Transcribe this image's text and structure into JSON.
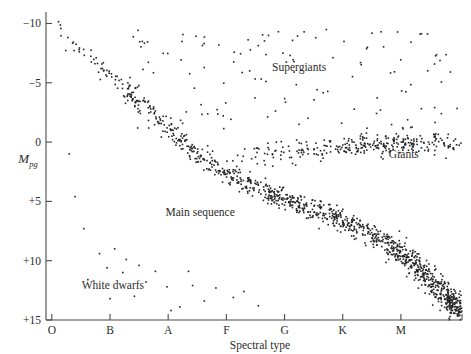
{
  "chart_data": {
    "type": "scatter",
    "title": "",
    "subtitle": "",
    "xlabel": "Spectral type",
    "ylabel": "M",
    "ylabel_subscript": "pg",
    "ylabel_full": "Mpg",
    "grid": false,
    "legend_position": "none",
    "x_tick_labels": [
      "O",
      "B",
      "A",
      "F",
      "G",
      "K",
      "M"
    ],
    "x_tick_values": [
      0,
      1,
      2,
      3,
      4,
      5,
      6
    ],
    "xlim": [
      -0.1,
      7.05
    ],
    "y_tick_labels": [
      "−10",
      "−5",
      "0",
      "+5",
      "+10",
      "+15"
    ],
    "y_tick_values": [
      -10,
      -5,
      0,
      5,
      10,
      15
    ],
    "ylim": [
      -10.8,
      15.0
    ],
    "y_axis_inverted": true,
    "point_color": "#242424",
    "point_size_px": 1.6,
    "axis_color": "#4a4a4a",
    "background_color": "#ffffff",
    "annotations": [
      {
        "id": "supergiants",
        "text": "Supergiants",
        "x": 4.25,
        "y": -6.0
      },
      {
        "id": "giants",
        "text": "Giants",
        "x": 6.05,
        "y": 1.35
      },
      {
        "id": "main-sequence",
        "text": "Main sequence",
        "x": 2.55,
        "y": 6.2
      },
      {
        "id": "white-dwarfs",
        "text": "White dwarfs",
        "x": 1.05,
        "y": 12.4
      }
    ],
    "series": [
      {
        "name": "Main sequence",
        "description": "Dense diagonal band from hot luminous O stars at upper-left to cool faint M dwarfs at lower-right",
        "n_points": 1150,
        "point_count_estimate": 1150,
        "band_path": [
          {
            "x": 0.02,
            "y": -10.2
          },
          {
            "x": 0.35,
            "y": -8.6
          },
          {
            "x": 0.75,
            "y": -6.8
          },
          {
            "x": 1.15,
            "y": -5.0
          },
          {
            "x": 1.55,
            "y": -3.2
          },
          {
            "x": 1.95,
            "y": -1.4
          },
          {
            "x": 2.35,
            "y": 0.4
          },
          {
            "x": 2.8,
            "y": 2.0
          },
          {
            "x": 3.3,
            "y": 3.4
          },
          {
            "x": 3.8,
            "y": 4.4
          },
          {
            "x": 4.3,
            "y": 5.3
          },
          {
            "x": 4.8,
            "y": 6.2
          },
          {
            "x": 5.3,
            "y": 7.3
          },
          {
            "x": 5.8,
            "y": 8.7
          },
          {
            "x": 6.2,
            "y": 10.2
          },
          {
            "x": 6.55,
            "y": 11.8
          },
          {
            "x": 6.85,
            "y": 13.3
          },
          {
            "x": 7.0,
            "y": 14.3
          }
        ],
        "spread_y": 0.95,
        "density_profile": "sparse at O/B, increasing through F/G, peak density at K/M"
      },
      {
        "name": "Giants",
        "description": "Horizontal clump of evolved giants near absolute magnitude 0 to +1, spectral types G through M",
        "n_points": 300,
        "point_count_estimate": 300,
        "band_path": [
          {
            "x": 3.3,
            "y": 1.6
          },
          {
            "x": 3.9,
            "y": 1.1
          },
          {
            "x": 4.5,
            "y": 0.7
          },
          {
            "x": 5.1,
            "y": 0.4
          },
          {
            "x": 5.7,
            "y": 0.2
          },
          {
            "x": 6.3,
            "y": 0.1
          },
          {
            "x": 6.85,
            "y": 0.1
          }
        ],
        "spread_y": 1.1,
        "spread_x": 0.25
      },
      {
        "name": "Supergiants",
        "description": "Sparse scatter of very luminous stars spread horizontally across the top of the diagram",
        "n_points": 125,
        "point_count_estimate": 125,
        "x_range": [
          1.4,
          7.0
        ],
        "y_range": [
          -9.5,
          -1.0
        ],
        "distribution": "sparse uniform scatter"
      },
      {
        "name": "White dwarfs",
        "description": "Sparse faint sequence at lower-left, well below the main sequence",
        "n_points": 24,
        "point_count_estimate": 24,
        "points": [
          {
            "x": 0.55,
            "y": 7.3
          },
          {
            "x": 0.82,
            "y": 9.4
          },
          {
            "x": 1.08,
            "y": 9.0
          },
          {
            "x": 1.28,
            "y": 9.9
          },
          {
            "x": 1.5,
            "y": 10.4
          },
          {
            "x": 1.22,
            "y": 11.0
          },
          {
            "x": 1.78,
            "y": 10.9
          },
          {
            "x": 1.62,
            "y": 11.8
          },
          {
            "x": 1.98,
            "y": 12.2
          },
          {
            "x": 2.42,
            "y": 12.1
          },
          {
            "x": 2.82,
            "y": 12.3
          },
          {
            "x": 2.62,
            "y": 13.4
          },
          {
            "x": 3.12,
            "y": 13.1
          },
          {
            "x": 0.4,
            "y": 4.6
          },
          {
            "x": 2.2,
            "y": 13.9
          },
          {
            "x": 1.0,
            "y": 13.2
          },
          {
            "x": 3.55,
            "y": 13.8
          },
          {
            "x": 0.62,
            "y": 11.6
          },
          {
            "x": 2.05,
            "y": 14.2
          },
          {
            "x": 1.42,
            "y": 13.0
          },
          {
            "x": 3.3,
            "y": 12.6
          },
          {
            "x": 0.95,
            "y": 10.6
          },
          {
            "x": 2.35,
            "y": 10.9
          },
          {
            "x": 0.3,
            "y": 1.0
          }
        ]
      }
    ]
  },
  "figure": {
    "plot_left_px": 46,
    "plot_right_px": 462,
    "plot_top_px": 14,
    "plot_bottom_px": 320
  }
}
